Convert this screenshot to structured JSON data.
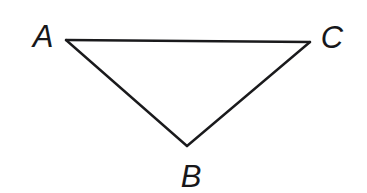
{
  "figure": {
    "name": "triangle-abc",
    "type": "geometry-diagram",
    "background_color": "#ffffff",
    "width": 367,
    "height": 193,
    "stroke_color": "#1a1a1c",
    "stroke_width": 2.4,
    "label_color": "#17171a",
    "label_font_size": 31,
    "label_font_style": "italic",
    "shape": {
      "kind": "triangle",
      "closed": true,
      "orientation": "apex-down",
      "vertices": [
        {
          "id": "A",
          "label": "A",
          "x": 66,
          "y": 40
        },
        {
          "id": "C",
          "label": "C",
          "x": 310,
          "y": 42
        },
        {
          "id": "B",
          "label": "B",
          "x": 187,
          "y": 146
        }
      ],
      "edges": [
        {
          "id": "AC",
          "from": "A",
          "to": "C"
        },
        {
          "id": "CB",
          "from": "C",
          "to": "B"
        },
        {
          "id": "BA",
          "from": "B",
          "to": "A"
        }
      ],
      "path": "M 66 40 L 310 42 L 187 146 Z"
    },
    "labels": [
      {
        "id": "label-a",
        "text": "A",
        "x": 43,
        "y": 47,
        "anchor": "middle",
        "for_vertex": "A"
      },
      {
        "id": "label-c",
        "text": "C",
        "x": 332,
        "y": 48,
        "anchor": "middle",
        "for_vertex": "C"
      },
      {
        "id": "label-b",
        "text": "B",
        "x": 191,
        "y": 187,
        "anchor": "middle",
        "for_vertex": "B"
      }
    ]
  }
}
